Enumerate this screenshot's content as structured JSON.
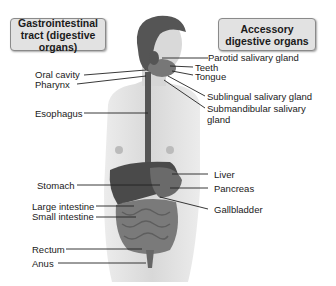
{
  "headers": {
    "left": "Gastrointestinal tract (digestive organs)",
    "right": "Accessory digestive organs"
  },
  "labels_left": {
    "oral_cavity": "Oral cavity",
    "pharynx": "Pharynx",
    "esophagus": "Esophagus",
    "stomach": "Stomach",
    "large_intestine": "Large intestine",
    "small_intestine": "Small intestine",
    "rectum": "Rectum",
    "anus": "Anus"
  },
  "labels_right": {
    "parotid": "Parotid salivary gland",
    "teeth": "Teeth",
    "tongue": "Tongue",
    "sublingual": "Sublingual salivary gland",
    "submandibular_1": "Submandibular salivary",
    "submandibular_2": "gland",
    "liver": "Liver",
    "pancreas": "Pancreas",
    "gallbladder": "Gallbladder"
  }
}
